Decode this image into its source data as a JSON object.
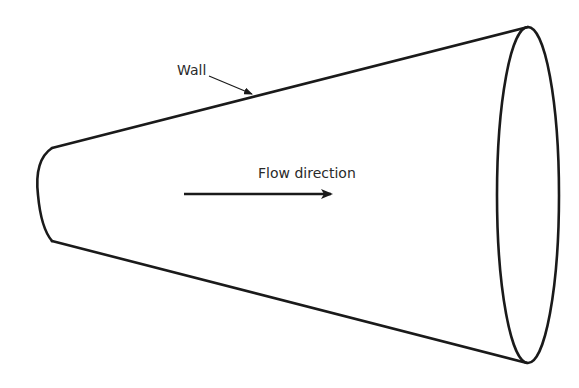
{
  "figure": {
    "labels": {
      "wall": "Wall",
      "flow": "Flow direction"
    },
    "colors": {
      "stroke": "#1a1a1a",
      "text": "#2a2a2a",
      "background": "#ffffff"
    },
    "elements": [
      {
        "name": "inlet-end",
        "shape": "arc",
        "description": "small end of cone (left)"
      },
      {
        "name": "outlet-end",
        "shape": "ellipse",
        "description": "large end of cone (right)"
      },
      {
        "name": "wall-top",
        "shape": "line"
      },
      {
        "name": "wall-bottom",
        "shape": "line"
      },
      {
        "name": "flow-arrow",
        "shape": "arrow",
        "direction": "right"
      },
      {
        "name": "wall-leader",
        "shape": "leader-arrow",
        "points_to": "wall-top"
      }
    ]
  }
}
